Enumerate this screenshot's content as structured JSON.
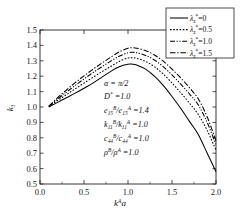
{
  "chart_data": {
    "type": "line",
    "title": "",
    "xlabel": "k^A a",
    "ylabel": "k3",
    "xlim": [
      0.0,
      2.0
    ],
    "ylim": [
      0.5,
      1.5
    ],
    "grid": false,
    "legend_position": "top-right",
    "x_ticks": [
      "0.0",
      "0.5",
      "1.0",
      "1.5",
      "2.0"
    ],
    "x_tick_values": [
      0.0,
      0.5,
      1.0,
      1.5,
      2.0
    ],
    "y_ticks": [
      "0.5",
      "0.6",
      "0.7",
      "0.8",
      "0.9",
      "1.0",
      "1.1",
      "1.2",
      "1.3",
      "1.4",
      "1.5"
    ],
    "y_tick_values": [
      0.5,
      0.6,
      0.7,
      0.8,
      0.9,
      1.0,
      1.1,
      1.2,
      1.3,
      1.4,
      1.5
    ],
    "x": [
      0.1,
      0.2,
      0.3,
      0.4,
      0.5,
      0.6,
      0.7,
      0.8,
      0.9,
      1.0,
      1.05,
      1.1,
      1.2,
      1.3,
      1.4,
      1.5,
      1.6,
      1.7,
      1.8,
      1.9,
      2.0
    ],
    "series": [
      {
        "name": "lambda*=0",
        "style": "solid",
        "values": [
          1.0,
          1.03,
          1.06,
          1.09,
          1.122,
          1.155,
          1.192,
          1.23,
          1.262,
          1.278,
          1.278,
          1.272,
          1.246,
          1.2,
          1.14,
          1.068,
          0.99,
          0.905,
          0.82,
          0.7,
          0.58
        ]
      },
      {
        "name": "lambda*=0.5",
        "style": "dotted",
        "values": [
          1.002,
          1.042,
          1.08,
          1.118,
          1.155,
          1.192,
          1.228,
          1.262,
          1.296,
          1.318,
          1.32,
          1.316,
          1.296,
          1.262,
          1.214,
          1.156,
          1.092,
          1.024,
          0.95,
          0.848,
          0.72
        ]
      },
      {
        "name": "lambda*=1.0",
        "style": "dashdotdot",
        "values": [
          1.004,
          1.052,
          1.096,
          1.14,
          1.182,
          1.222,
          1.26,
          1.296,
          1.33,
          1.352,
          1.355,
          1.352,
          1.335,
          1.305,
          1.262,
          1.208,
          1.148,
          1.084,
          1.012,
          0.9,
          0.755
        ]
      },
      {
        "name": "lambda*=1.5",
        "style": "dashdot",
        "values": [
          1.006,
          1.06,
          1.11,
          1.158,
          1.202,
          1.244,
          1.284,
          1.322,
          1.358,
          1.382,
          1.385,
          1.382,
          1.366,
          1.338,
          1.298,
          1.246,
          1.188,
          1.124,
          1.052,
          0.935,
          0.78
        ]
      }
    ],
    "legend_entries": [
      {
        "symbol": "λ",
        "subscript": "z",
        "superscript": "*",
        "value": "0",
        "style": "solid"
      },
      {
        "symbol": "λ",
        "subscript": "z",
        "superscript": "*",
        "value": "0.5",
        "style": "dotted"
      },
      {
        "symbol": "λ",
        "subscript": "z",
        "superscript": "*",
        "value": "1.0",
        "style": "dashdotdot"
      },
      {
        "symbol": "λ",
        "subscript": "z",
        "superscript": "*",
        "value": "1.5",
        "style": "dashdot"
      }
    ],
    "annotations": [
      {
        "id": "alpha",
        "text": "α = π/2"
      },
      {
        "id": "dstar",
        "text": "D* =1.0"
      },
      {
        "id": "e15",
        "text": "e15B/e15A =1.4"
      },
      {
        "id": "k11",
        "text": "k11B/k11A =1.0"
      },
      {
        "id": "c44",
        "text": "c44B/c44A =1.0"
      },
      {
        "id": "rho",
        "text": "ρB/ρA =1.0"
      }
    ]
  },
  "labels": {
    "y_axis_title_base": "k",
    "y_axis_title_sub": "3",
    "x_axis_title_base": "k",
    "x_axis_title_sup": "A",
    "x_axis_title_tail": "a",
    "legend_lambda": "λ",
    "legend_lambda_sub": "z",
    "legend_lambda_sup": "*",
    "eq": "=",
    "alpha_text": "α = π/2",
    "d_base": "D",
    "d_sup": "*",
    "d_val": "=1.0",
    "e_base": "e",
    "e_sub": "15",
    "e_supB": "B",
    "e_supA": "A",
    "e_val": "=1.4",
    "k_base": "k",
    "k_sub": "11",
    "k_val": "=1.0",
    "c_base": "c",
    "c_sub": "44",
    "c_val": "=1.0",
    "rho_base": "ρ",
    "rho_val": "=1.0",
    "slash": "/"
  }
}
